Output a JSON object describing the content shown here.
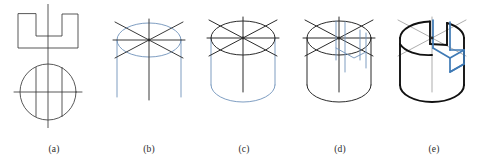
{
  "figure": {
    "colors": {
      "line_black": "#2b2b2b",
      "line_bold_black": "#111111",
      "line_blue": "#6f92ba",
      "line_blue_strong": "#3f7ab5",
      "background": "#ffffff"
    },
    "panels": [
      {
        "id": "a",
        "caption": "(a)",
        "step_name": "orthographic-views",
        "description": "Front view: rectangle with rectangular notch cut from the top centre. Top view: circle with two vertical chord lines and horizontal/vertical centrelines.",
        "elements": [
          "notched-rectangle-front-view",
          "circle-top-view",
          "vertical-centerline",
          "horizontal-centerline",
          "chord-line-left",
          "chord-line-right"
        ],
        "stroke": "#2b2b2b"
      },
      {
        "id": "b",
        "caption": "(b)",
        "step_name": "top-ellipse-and-axes",
        "description": "Blue isometric ellipse for the top face with black isometric axes (30-degree cross and vertical centre axis); blue vertical side lines started.",
        "elements": [
          "top-ellipse",
          "isometric-axis-left",
          "isometric-axis-right",
          "isometric-axis-horizontal",
          "isometric-axis-vertical",
          "side-line-left",
          "side-line-right",
          "center-axis-line"
        ],
        "stroke": "#6f92ba",
        "accent": "#2b2b2b"
      },
      {
        "id": "c",
        "caption": "(c)",
        "step_name": "cylinder-body",
        "description": "Top ellipse and axes now drawn in black; the cylinder body, its vertical sides and the bottom arc are drawn in light blue.",
        "elements": [
          "top-ellipse",
          "isometric-axes",
          "body-left-side",
          "body-right-side",
          "bottom-arc"
        ],
        "stroke": "#2b2b2b",
        "accent": "#6f92ba"
      },
      {
        "id": "d",
        "caption": "(d)",
        "step_name": "notch-construction-lines",
        "description": "Complete cylinder drawn in black; light blue vertical construction lines are projected down from the top ellipse to locate the notch walls.",
        "elements": [
          "complete-cylinder",
          "top-ellipse",
          "isometric-axes",
          "notch-construction-line-1",
          "notch-construction-line-2",
          "notch-construction-line-3",
          "notch-construction-line-4"
        ],
        "stroke": "#2b2b2b",
        "accent": "#6f92ba"
      },
      {
        "id": "e",
        "caption": "(e)",
        "step_name": "finished-notched-cylinder",
        "description": "Finished object: heavy black outline of the cylinder with the rectangular notch cut through the top; the curved notch floor and the blue notch profile faces are shown.",
        "elements": [
          "cylinder-outline-bold",
          "notch-floor-arc",
          "notch-face-blue",
          "notch-wall-blue",
          "top-ellipse-remnant",
          "construction-axes"
        ],
        "stroke": "#111111",
        "accent": "#3f7ab5"
      }
    ]
  }
}
